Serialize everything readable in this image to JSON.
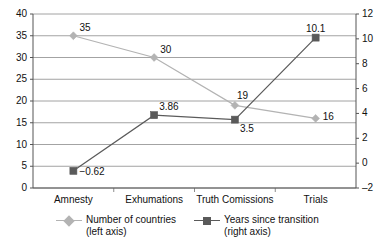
{
  "chart_data": {
    "type": "line",
    "title": "",
    "xlabel": "",
    "categories": [
      "Amnesty",
      "Exhumations",
      "Truth Comissions",
      "Trials"
    ],
    "series": [
      {
        "name": "Number of countries",
        "axis_note": "(left axis)",
        "axis": "left",
        "marker": "diamond",
        "color": "#b3b3b3",
        "values": [
          35,
          30,
          19,
          16
        ],
        "labels": [
          "35",
          "30",
          "19",
          "16"
        ]
      },
      {
        "name": "Years since transition",
        "axis_note": "(right axis)",
        "axis": "right",
        "marker": "square",
        "color": "#5a5a5a",
        "values": [
          -0.62,
          3.86,
          3.5,
          10.1
        ],
        "labels": [
          "−0.62",
          "3.86",
          "3.5",
          "10.1"
        ]
      }
    ],
    "left_axis": {
      "label": "",
      "min": 0,
      "max": 40,
      "step": 5,
      "ticks": [
        "0",
        "5",
        "10",
        "15",
        "20",
        "25",
        "30",
        "35",
        "40"
      ]
    },
    "right_axis": {
      "label": "",
      "min": -2,
      "max": 12,
      "step": 2,
      "ticks": [
        "-2",
        "0",
        "2",
        "4",
        "6",
        "8",
        "10",
        "12"
      ]
    },
    "grid": {
      "horizontal": true,
      "vertical": false,
      "color": "#8c8c8c"
    },
    "legend": {
      "position": "bottom",
      "entries": [
        {
          "label": "Number of countries",
          "sublabel": "(left axis)",
          "marker": "diamond",
          "color": "#b3b3b3"
        },
        {
          "label": "Years since transition",
          "sublabel": "(right axis)",
          "marker": "square",
          "color": "#5a5a5a"
        }
      ]
    }
  }
}
